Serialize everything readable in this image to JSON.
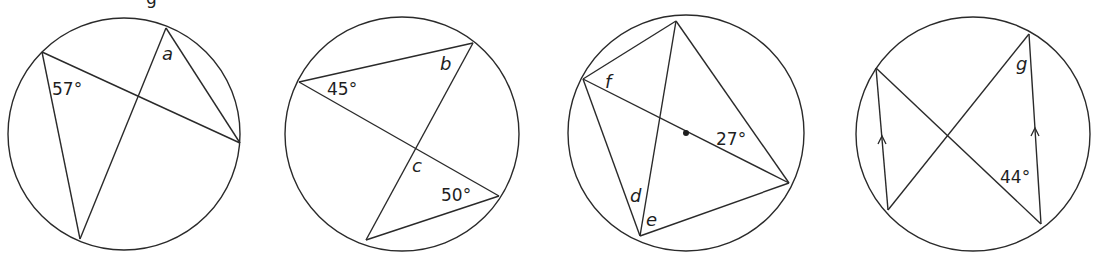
{
  "header_fragment": {
    "text": "g"
  },
  "diagrams": [
    {
      "id": "circle-1",
      "circle": {
        "cx": 124,
        "cy": 134,
        "r": 116
      },
      "points": {
        "A": [
          42,
          52
        ],
        "B": [
          166,
          28
        ],
        "C": [
          240,
          143
        ],
        "D": [
          80,
          239
        ]
      },
      "chords": [
        [
          "A",
          "C"
        ],
        [
          "A",
          "D"
        ],
        [
          "B",
          "D"
        ],
        [
          "B",
          "C"
        ]
      ],
      "labels": [
        {
          "text": "57°",
          "x": 52,
          "y": 95,
          "kind": "angle"
        },
        {
          "text": "a",
          "x": 162,
          "y": 60,
          "kind": "unknown"
        }
      ]
    },
    {
      "id": "circle-2",
      "circle": {
        "cx": 402,
        "cy": 134,
        "r": 117
      },
      "points": {
        "A": [
          299,
          82
        ],
        "B": [
          473,
          43
        ],
        "C": [
          366,
          240
        ],
        "D": [
          499,
          196
        ]
      },
      "chords": [
        [
          "A",
          "B"
        ],
        [
          "A",
          "D"
        ],
        [
          "B",
          "C"
        ],
        [
          "C",
          "D"
        ]
      ],
      "labels": [
        {
          "text": "45°",
          "x": 327,
          "y": 95,
          "kind": "angle"
        },
        {
          "text": "b",
          "x": 440,
          "y": 70,
          "kind": "unknown"
        },
        {
          "text": "c",
          "x": 412,
          "y": 172,
          "kind": "unknown"
        },
        {
          "text": "50°",
          "x": 441,
          "y": 201,
          "kind": "angle"
        }
      ]
    },
    {
      "id": "circle-3",
      "circle": {
        "cx": 686,
        "cy": 133,
        "r": 118
      },
      "center_dot": [
        686,
        133
      ],
      "points": {
        "A": [
          676,
          21
        ],
        "B": [
          583,
          79
        ],
        "C": [
          640,
          236
        ],
        "D": [
          789,
          183
        ]
      },
      "chords": [
        [
          "A",
          "B"
        ],
        [
          "A",
          "C"
        ],
        [
          "A",
          "D"
        ],
        [
          "B",
          "C"
        ],
        [
          "B",
          "D"
        ],
        [
          "C",
          "D"
        ]
      ],
      "labels": [
        {
          "text": "f",
          "x": 605,
          "y": 88,
          "kind": "unknown"
        },
        {
          "text": "27°",
          "x": 716,
          "y": 145,
          "kind": "angle"
        },
        {
          "text": "d",
          "x": 630,
          "y": 202,
          "kind": "unknown"
        },
        {
          "text": "e",
          "x": 646,
          "y": 226,
          "kind": "unknown"
        }
      ]
    },
    {
      "id": "circle-4",
      "circle": {
        "cx": 973,
        "cy": 134,
        "r": 117
      },
      "points": {
        "A": [
          876,
          68
        ],
        "B": [
          1029,
          34
        ],
        "C": [
          888,
          210
        ],
        "D": [
          1041,
          224
        ]
      },
      "chords": [
        [
          "A",
          "C"
        ],
        [
          "B",
          "D"
        ],
        [
          "A",
          "D"
        ],
        [
          "B",
          "C"
        ]
      ],
      "parallel_arrows": [
        {
          "x": 882,
          "y": 138
        },
        {
          "x": 1035,
          "y": 130
        }
      ],
      "labels": [
        {
          "text": "g",
          "x": 1016,
          "y": 70,
          "kind": "unknown"
        },
        {
          "text": "44°",
          "x": 1000,
          "y": 183,
          "kind": "angle"
        }
      ]
    }
  ]
}
